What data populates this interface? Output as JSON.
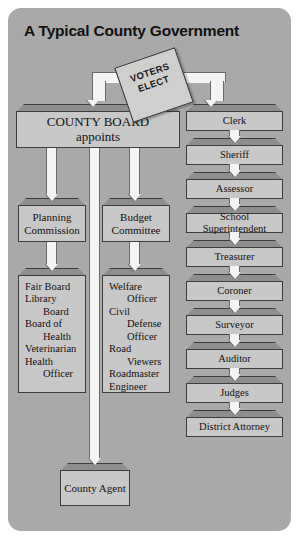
{
  "panel": {
    "title": "A Typical County Government",
    "bg_color": "#a9a9a9",
    "node_fill": "#c8c8c8",
    "node_cap": "#8e8e8e",
    "connector_color": "#f4f4f2"
  },
  "ballot": {
    "line1": "VOTERS",
    "line2": "ELECT",
    "name": "voters-elect-ballot"
  },
  "board": {
    "line1": "COUNTY BOARD",
    "line2": "appoints"
  },
  "appointed": {
    "planning": "Planning Commission",
    "budget": "Budget Committee",
    "county_agent": "County Agent",
    "planning_list": [
      {
        "text": "Fair Board",
        "indent": false
      },
      {
        "text": "Library",
        "indent": false
      },
      {
        "text": "Board",
        "indent": true
      },
      {
        "text": "Board of",
        "indent": false
      },
      {
        "text": "Health",
        "indent": true
      },
      {
        "text": "Veterinarian",
        "indent": false
      },
      {
        "text": "Health",
        "indent": false
      },
      {
        "text": "Officer",
        "indent": true
      }
    ],
    "budget_list": [
      {
        "text": "Welfare",
        "indent": false
      },
      {
        "text": "Officer",
        "indent": true
      },
      {
        "text": "Civil",
        "indent": false
      },
      {
        "text": "Defense",
        "indent": true
      },
      {
        "text": "Officer",
        "indent": true
      },
      {
        "text": "Road",
        "indent": false
      },
      {
        "text": "Viewers",
        "indent": true
      },
      {
        "text": "Roadmaster",
        "indent": false
      },
      {
        "text": "Engineer",
        "indent": false
      }
    ]
  },
  "elected": {
    "items": [
      "Clerk",
      "Sheriff",
      "Assessor",
      "School Superintendent",
      "Treasurer",
      "Coroner",
      "Surveyor",
      "Auditor",
      "Judges",
      "District Attorney"
    ]
  },
  "chart_data": {
    "type": "diagram",
    "diagram_type": "organizational-chart",
    "title": "A Typical County Government",
    "root": {
      "label": "VOTERS ELECT",
      "shape": "tilted-ballot"
    },
    "branches": [
      {
        "label": "COUNTY BOARD appoints",
        "children": [
          {
            "label": "Planning Commission",
            "children": [
              "Fair Board",
              "Library Board",
              "Board of Health",
              "Veterinarian",
              "Health Officer"
            ]
          },
          {
            "label": "Budget Committee",
            "children": [
              "Welfare Officer",
              "Civil Defense Officer",
              "Road Viewers",
              "Roadmaster",
              "Engineer"
            ]
          },
          {
            "label": "County Agent",
            "children": []
          }
        ]
      },
      {
        "label": "Elected officials",
        "children": [
          "Clerk",
          "Sheriff",
          "Assessor",
          "School Superintendent",
          "Treasurer",
          "Coroner",
          "Surveyor",
          "Auditor",
          "Judges",
          "District Attorney"
        ]
      }
    ]
  }
}
